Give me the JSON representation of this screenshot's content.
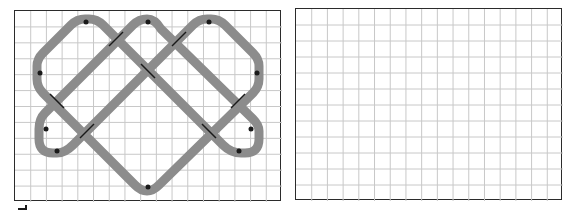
{
  "figure": {
    "panels": [
      {
        "id": "left",
        "content": "knot-pattern"
      },
      {
        "id": "right",
        "content": "empty-grid"
      }
    ],
    "grid": {
      "columns": 17,
      "rows": 12
    },
    "colors": {
      "grid_line": "#c8c8c8",
      "border": "#2b2b2b",
      "knot_band": "#8c8c8c",
      "crossing_mark": "#1a1a1a",
      "background": "#ffffff"
    },
    "knot": {
      "crossings": 8,
      "top_arcs": 3,
      "side_lobes": 4,
      "bottom_point": 1
    }
  }
}
